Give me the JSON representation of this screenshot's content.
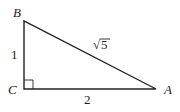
{
  "diagram": {
    "type": "right-triangle",
    "vertices": {
      "B": {
        "label": "B",
        "x": 24,
        "y": 21
      },
      "C": {
        "label": "C",
        "x": 24,
        "y": 89
      },
      "A": {
        "label": "A",
        "x": 156,
        "y": 89
      }
    },
    "sides": {
      "BC": "1",
      "CA": "2",
      "AB_radical": "√",
      "AB_radicand": "5"
    },
    "right_angle_at": "C",
    "stroke_color": "#222222"
  }
}
